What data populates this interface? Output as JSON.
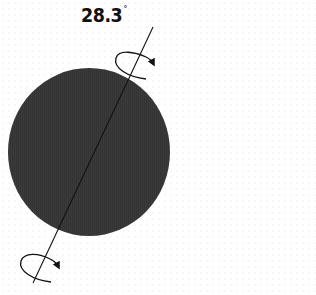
{
  "label": {
    "value": "28.3",
    "unit": "°"
  },
  "colors": {
    "planet": "#3a3a3a",
    "axis": "#111111",
    "background": "#ffffff"
  },
  "icons": {
    "rotation_top": "rotation-arrow-icon",
    "rotation_bottom": "rotation-arrow-icon"
  }
}
